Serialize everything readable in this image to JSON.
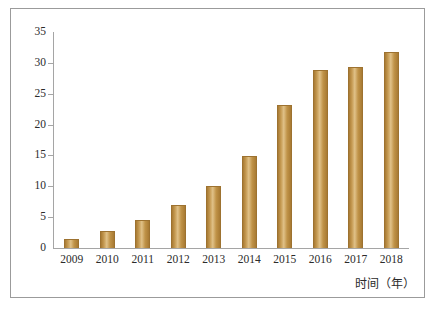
{
  "chart_data": {
    "type": "bar",
    "title": "",
    "subtitle": "",
    "xlabel": "时间（年）",
    "ylabel": "",
    "categories": [
      "2009",
      "2010",
      "2011",
      "2012",
      "2013",
      "2014",
      "2015",
      "2016",
      "2017",
      "2018"
    ],
    "values": [
      1.5,
      2.7,
      4.5,
      7.0,
      10.1,
      14.9,
      23.2,
      28.9,
      29.3,
      31.8
    ],
    "yticks": [
      0,
      5,
      10,
      15,
      20,
      25,
      30,
      35
    ],
    "ylim": [
      0,
      35
    ],
    "grid": false,
    "legend": null,
    "legend_position": "none",
    "series": [
      {
        "name": "",
        "values": [
          1.5,
          2.7,
          4.5,
          7.0,
          10.1,
          14.9,
          23.2,
          28.9,
          29.3,
          31.8
        ]
      }
    ]
  },
  "style": {
    "bar_color": "#b8873c",
    "bar_edge_color": "#9d7230",
    "axis_color": "#a5a5a5",
    "frame_color": "#9b9b9b",
    "text_color": "#2b2b2b",
    "background": "#ffffff"
  }
}
